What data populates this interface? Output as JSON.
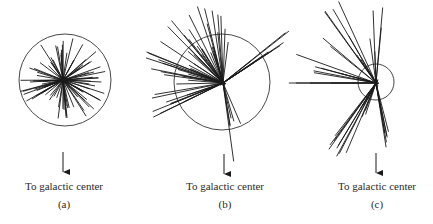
{
  "panels": [
    {
      "id": "a",
      "label": "(a)",
      "caption": "To galactic center",
      "circle": {
        "cx": 65,
        "cy": 80,
        "r": 46
      },
      "origin": [
        63,
        80
      ],
      "arrow_x": 63,
      "description": "Isotropic distribution of globular cluster velocity vectors around the circle center"
    },
    {
      "id": "b",
      "label": "(b)",
      "caption": "To galactic center",
      "circle": {
        "cx": 222,
        "cy": 82,
        "r": 48
      },
      "origin": [
        223,
        83
      ],
      "arrow_x": 224,
      "description": "Observer displaced; vectors converge off-center"
    },
    {
      "id": "c",
      "label": "(c)",
      "caption": "To galactic center",
      "circle": {
        "cx": 376,
        "cy": 82,
        "r": 18
      },
      "origin": [
        376,
        83
      ],
      "arrow_x": 376,
      "description": "Small circle with long vectors extending mostly to the left"
    }
  ],
  "colors": {
    "stroke": "#1a1a1a",
    "circle": "#333333",
    "text": "#2a2a2a"
  }
}
